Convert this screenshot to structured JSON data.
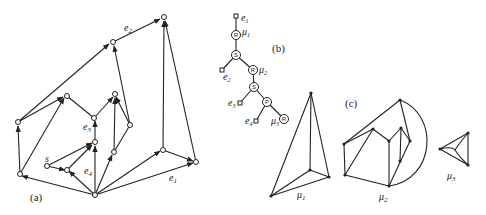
{
  "figure_a": {
    "caption": "(a)",
    "edge_labels": {
      "e1": "e",
      "e1_sub": "1",
      "e2": "e",
      "e2_sub": "2",
      "e3": "e",
      "e3_sub": "3",
      "e4": "e",
      "e4_sub": "4",
      "s": "s"
    }
  },
  "figure_b": {
    "caption": "(b)",
    "nodes": [
      {
        "type": "R",
        "label": "μ",
        "sub": "1"
      },
      {
        "type": "S"
      },
      {
        "type": "R",
        "label": "μ",
        "sub": "2"
      },
      {
        "type": "S"
      },
      {
        "type": "P"
      },
      {
        "type": "R",
        "label": "μ",
        "sub": "3"
      }
    ],
    "leaves": [
      {
        "label": "e",
        "sub": "1"
      },
      {
        "label": "e",
        "sub": "2"
      },
      {
        "label": "e",
        "sub": "3"
      },
      {
        "label": "e",
        "sub": "4"
      }
    ]
  },
  "figure_c": {
    "caption": "(c)",
    "components": [
      {
        "label": "μ",
        "sub": "1"
      },
      {
        "label": "μ",
        "sub": "2"
      },
      {
        "label": "μ",
        "sub": "3"
      }
    ]
  }
}
